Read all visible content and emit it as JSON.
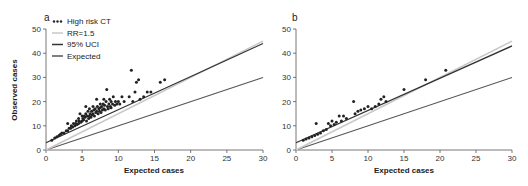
{
  "chart_data": [
    {
      "panel": "a",
      "type": "scatter",
      "xlabel": "Expected cases",
      "ylabel": "Observed cases",
      "xlim": [
        0,
        30
      ],
      "ylim": [
        0,
        50
      ],
      "xticks": [
        0,
        5,
        10,
        15,
        20,
        25,
        30
      ],
      "yticks": [
        0,
        10,
        20,
        30,
        40,
        50
      ],
      "grid": false,
      "legend_position": "top-left",
      "legend": [
        {
          "label": "High risk CT",
          "style": "dots",
          "color": "#222222"
        },
        {
          "label": "RR=1.5",
          "style": "line",
          "color": "#c8c8c8"
        },
        {
          "label": "95% UCI",
          "style": "line",
          "color": "#333333"
        },
        {
          "label": "Expected",
          "style": "line",
          "color": "#555555"
        }
      ],
      "lines": [
        {
          "name": "RR=1.5",
          "x": [
            0,
            30
          ],
          "y": [
            0,
            45
          ]
        },
        {
          "name": "95% UCI",
          "x": [
            0,
            30
          ],
          "y": [
            3,
            44
          ]
        },
        {
          "name": "Expected",
          "x": [
            0,
            30
          ],
          "y": [
            0,
            30
          ]
        }
      ],
      "series": [
        {
          "name": "High risk CT",
          "points": [
            [
              0.8,
              4
            ],
            [
              1.2,
              5
            ],
            [
              1.5,
              5.5
            ],
            [
              1.8,
              6
            ],
            [
              2.0,
              6.5
            ],
            [
              2.2,
              7
            ],
            [
              2.5,
              7
            ],
            [
              2.8,
              8
            ],
            [
              3.0,
              8
            ],
            [
              3.0,
              11
            ],
            [
              3.2,
              9
            ],
            [
              3.4,
              9
            ],
            [
              3.5,
              10
            ],
            [
              3.7,
              9.5
            ],
            [
              3.8,
              11
            ],
            [
              4.0,
              10
            ],
            [
              4.1,
              11
            ],
            [
              4.2,
              12
            ],
            [
              4.3,
              10.5
            ],
            [
              4.5,
              11
            ],
            [
              4.5,
              13
            ],
            [
              4.6,
              12
            ],
            [
              4.7,
              15
            ],
            [
              4.8,
              11.5
            ],
            [
              5.0,
              12
            ],
            [
              5.0,
              14
            ],
            [
              5.1,
              13
            ],
            [
              5.2,
              12.5
            ],
            [
              5.3,
              14
            ],
            [
              5.4,
              13.5
            ],
            [
              5.5,
              15
            ],
            [
              5.5,
              18
            ],
            [
              5.6,
              12
            ],
            [
              5.7,
              14
            ],
            [
              5.8,
              16
            ],
            [
              5.9,
              13
            ],
            [
              6.0,
              14
            ],
            [
              6.0,
              17
            ],
            [
              6.1,
              15
            ],
            [
              6.2,
              13.5
            ],
            [
              6.3,
              16
            ],
            [
              6.4,
              14.5
            ],
            [
              6.5,
              15
            ],
            [
              6.5,
              18
            ],
            [
              6.6,
              16.5
            ],
            [
              6.7,
              14
            ],
            [
              6.8,
              17
            ],
            [
              6.9,
              15.5
            ],
            [
              7.0,
              16
            ],
            [
              7.0,
              21
            ],
            [
              7.1,
              18
            ],
            [
              7.2,
              15
            ],
            [
              7.3,
              17
            ],
            [
              7.4,
              16
            ],
            [
              7.5,
              19
            ],
            [
              7.5,
              17.5
            ],
            [
              7.6,
              15.5
            ],
            [
              7.7,
              18
            ],
            [
              7.8,
              16.5
            ],
            [
              7.9,
              19
            ],
            [
              8.0,
              17
            ],
            [
              8.0,
              21
            ],
            [
              8.1,
              18.5
            ],
            [
              8.2,
              16.5
            ],
            [
              8.3,
              20
            ],
            [
              8.4,
              25
            ],
            [
              8.5,
              18
            ],
            [
              8.6,
              17
            ],
            [
              8.7,
              19
            ],
            [
              8.8,
              21
            ],
            [
              8.9,
              18
            ],
            [
              9.0,
              20
            ],
            [
              9.0,
              17.5
            ],
            [
              9.2,
              19
            ],
            [
              9.3,
              22
            ],
            [
              9.5,
              18.5
            ],
            [
              9.6,
              20
            ],
            [
              9.8,
              19
            ],
            [
              10.0,
              20
            ],
            [
              10.2,
              19
            ],
            [
              10.5,
              22
            ],
            [
              10.8,
              20
            ],
            [
              11.5,
              22
            ],
            [
              11.8,
              33
            ],
            [
              12.0,
              20
            ],
            [
              12.3,
              24
            ],
            [
              12.5,
              28
            ],
            [
              12.8,
              29
            ],
            [
              13.0,
              21
            ],
            [
              13.5,
              22
            ],
            [
              14.0,
              24
            ],
            [
              14.5,
              24
            ],
            [
              15.8,
              28
            ],
            [
              16.4,
              29
            ]
          ]
        }
      ]
    },
    {
      "panel": "b",
      "type": "scatter",
      "xlabel": "Expected cases",
      "ylabel": "",
      "xlim": [
        0,
        30
      ],
      "ylim": [
        0,
        50
      ],
      "xticks": [
        0,
        5,
        10,
        15,
        20,
        25,
        30
      ],
      "yticks": [
        0,
        10,
        20,
        30,
        40,
        50
      ],
      "grid": false,
      "lines": [
        {
          "name": "RR=1.5",
          "x": [
            0,
            30
          ],
          "y": [
            0,
            45
          ]
        },
        {
          "name": "95% UCI",
          "x": [
            0,
            30
          ],
          "y": [
            3,
            43
          ]
        },
        {
          "name": "Expected",
          "x": [
            0,
            30
          ],
          "y": [
            0,
            30
          ]
        }
      ],
      "series": [
        {
          "name": "High risk CT",
          "points": [
            [
              1.0,
              4
            ],
            [
              1.4,
              4.5
            ],
            [
              1.8,
              5
            ],
            [
              2.2,
              5.5
            ],
            [
              2.6,
              6
            ],
            [
              2.8,
              11
            ],
            [
              3.0,
              6.5
            ],
            [
              3.4,
              7
            ],
            [
              3.8,
              8
            ],
            [
              4.2,
              8.5
            ],
            [
              4.5,
              11
            ],
            [
              4.8,
              10
            ],
            [
              5.0,
              12
            ],
            [
              5.3,
              10.5
            ],
            [
              5.6,
              11.5
            ],
            [
              6.0,
              14
            ],
            [
              6.3,
              12
            ],
            [
              6.6,
              14
            ],
            [
              7.0,
              13
            ],
            [
              8.0,
              20
            ],
            [
              8.2,
              15
            ],
            [
              8.6,
              16
            ],
            [
              9.0,
              16.5
            ],
            [
              9.5,
              17
            ],
            [
              10.0,
              18
            ],
            [
              10.5,
              17
            ],
            [
              11.0,
              18
            ],
            [
              11.5,
              19
            ],
            [
              11.8,
              21
            ],
            [
              12.2,
              22
            ],
            [
              12.5,
              20
            ],
            [
              15.0,
              25
            ],
            [
              18.0,
              29
            ],
            [
              20.8,
              33
            ]
          ]
        }
      ]
    }
  ],
  "panels": {
    "a": {
      "label": "a"
    },
    "b": {
      "label": "b"
    }
  }
}
